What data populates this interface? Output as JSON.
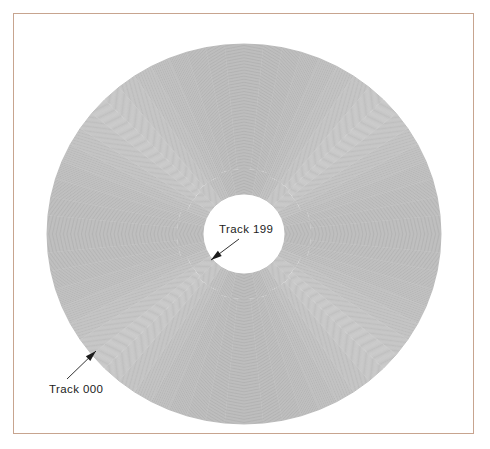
{
  "page": {
    "background_color": "#ffffff",
    "frame": {
      "name": "page-border",
      "color": "#c7a48f",
      "x": 13,
      "y": 13,
      "width": 461,
      "height": 421
    }
  },
  "chart_data": {
    "type": "scatter",
    "title": "",
    "subtitle": "",
    "xlabel": "",
    "ylabel": "",
    "grid": false,
    "legend": null,
    "geometry": {
      "center_x": 244,
      "center_y": 234,
      "outer_radius_x": 197,
      "outer_radius_y": 190,
      "hub_radius_x": 41,
      "hub_radius_y": 40,
      "track_count": 200,
      "track_color": "#8c8c8c",
      "track_stroke_width": 0.55,
      "hub_fill": "#ffffff"
    },
    "categories": [
      "Track 000",
      "Track 199"
    ],
    "values": [
      0,
      199
    ],
    "annotations": [
      {
        "id": "track-000",
        "label": "Track 000",
        "track_number": "000",
        "position": "outermost",
        "text_x": 49,
        "text_y": 393,
        "arrow_tail_x": 67,
        "arrow_tail_y": 379,
        "arrow_head_x": 96,
        "arrow_head_y": 351
      },
      {
        "id": "track-199",
        "label": "Track 199",
        "track_number": "199",
        "position": "innermost",
        "text_x": 219,
        "text_y": 233,
        "arrow_tail_x": 239,
        "arrow_tail_y": 239,
        "arrow_head_x": 211,
        "arrow_head_y": 260
      }
    ]
  }
}
